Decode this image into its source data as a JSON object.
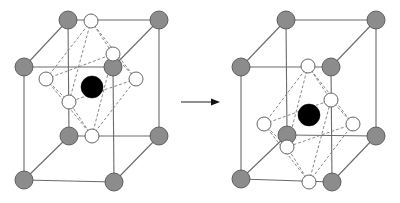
{
  "diagram": {
    "title": "",
    "colors": {
      "corner_atom": "#8c8c8c",
      "octahedral_atom": "#ffffff",
      "central_atom": "#000000",
      "edge": "#6a6a6a",
      "dashed": "#7a7a7a"
    },
    "arrow": {
      "x1": 181,
      "y1": 102,
      "x2": 220,
      "y2": 102,
      "meaning": "transforms-to"
    },
    "cells": [
      {
        "name": "left-cell",
        "state": "undistorted",
        "corners": {
          "tbl": [
            68,
            20
          ],
          "tbr": [
            159,
            20
          ],
          "bbl": [
            69,
            136
          ],
          "bbr": [
            159,
            136
          ],
          "tfl": [
            24,
            67
          ],
          "tfr": [
            113,
            67
          ],
          "bfl": [
            24,
            180
          ],
          "bfr": [
            114,
            182
          ]
        },
        "octahedron": {
          "top": [
            91,
            21
          ],
          "bottom": [
            92,
            136
          ],
          "left": [
            46,
            79
          ],
          "right": [
            136,
            79
          ],
          "back": [
            113,
            54
          ],
          "front": [
            69,
            102
          ]
        },
        "center": [
          92,
          87
        ]
      },
      {
        "name": "right-cell",
        "state": "distorted",
        "corners": {
          "tbl": [
            286,
            20
          ],
          "tbr": [
            376,
            20
          ],
          "bbl": [
            287,
            135
          ],
          "bbr": [
            376,
            136
          ],
          "tfl": [
            241,
            67
          ],
          "tfr": [
            331,
            67
          ],
          "bfl": [
            241,
            179
          ],
          "bfr": [
            332,
            182
          ]
        },
        "octahedron": {
          "top": [
            308,
            66
          ],
          "bottom": [
            309,
            182
          ],
          "left": [
            264,
            124
          ],
          "right": [
            353,
            124
          ],
          "back": [
            331,
            100
          ],
          "front": [
            287,
            147
          ]
        },
        "center": [
          309,
          115
        ]
      }
    ],
    "radii": {
      "corner": 9,
      "octahedral": 7,
      "center": 11
    }
  }
}
